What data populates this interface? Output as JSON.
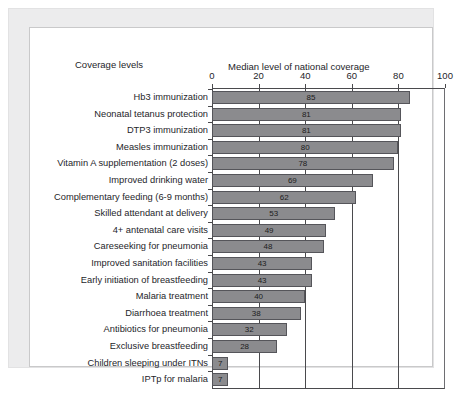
{
  "headers": {
    "coverage_levels": "Coverage levels"
  },
  "chart_data": {
    "type": "bar",
    "orientation": "horizontal",
    "title": "Median level of national coverage",
    "xlabel": "",
    "ylabel": "",
    "xlim": [
      0,
      100
    ],
    "xticks": [
      0,
      20,
      40,
      60,
      80,
      100
    ],
    "tick_labels": [
      "0",
      "20",
      "40",
      "60",
      "80",
      "100"
    ],
    "grid": true,
    "legend": false,
    "bar_color": "#8b8b8e",
    "bar_border_color": "#55555a",
    "axis_color": "#4a4a4d",
    "categories": [
      "Hb3 immunization",
      "Neonatal tetanus protection",
      "DTP3 immunization",
      "Measles immunization",
      "Vitamin A supplementation (2 doses)",
      "Improved drinking water",
      "Complementary feeding (6-9 months)",
      "Skilled attendant at delivery",
      "4+ antenatal care visits",
      "Careseeking for pneumonia",
      "Improved sanitation facilities",
      "Early initiation of breastfeeding",
      "Malaria treatment",
      "Diarrhoea treatment",
      "Antibiotics for pneumonia",
      "Exclusive breastfeeding",
      "Children sleeping under ITNs",
      "IPTp for malaria"
    ],
    "values": [
      85,
      81,
      81,
      80,
      78,
      69,
      62,
      53,
      49,
      48,
      43,
      43,
      40,
      38,
      32,
      28,
      7,
      7
    ],
    "value_labels": [
      "85",
      "81",
      "81",
      "80",
      "78",
      "69",
      "62",
      "53",
      "49",
      "48",
      "43",
      "43",
      "40",
      "38",
      "32",
      "28",
      "7",
      "7"
    ]
  }
}
